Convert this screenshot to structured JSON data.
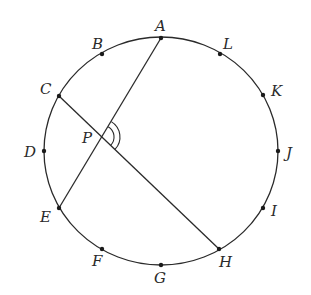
{
  "diagram": {
    "type": "circle-with-intersecting-chords",
    "circle": {
      "cx": 161,
      "cy": 151,
      "rx": 117,
      "ry": 114
    },
    "points": [
      {
        "name": "A",
        "x": 161,
        "y": 38,
        "label_x": 155,
        "label_y": 31
      },
      {
        "name": "B",
        "x": 102,
        "y": 54,
        "label_x": 92,
        "label_y": 49
      },
      {
        "name": "C",
        "x": 59,
        "y": 96,
        "label_x": 40,
        "label_y": 94
      },
      {
        "name": "D",
        "x": 44,
        "y": 151,
        "label_x": 24,
        "label_y": 157
      },
      {
        "name": "E",
        "x": 59,
        "y": 208,
        "label_x": 40,
        "label_y": 222
      },
      {
        "name": "F",
        "x": 102,
        "y": 249,
        "label_x": 92,
        "label_y": 266
      },
      {
        "name": "G",
        "x": 161,
        "y": 265,
        "label_x": 154,
        "label_y": 283
      },
      {
        "name": "H",
        "x": 219,
        "y": 249,
        "label_x": 219,
        "label_y": 267
      },
      {
        "name": "I",
        "x": 263,
        "y": 208,
        "label_x": 271,
        "label_y": 216
      },
      {
        "name": "J",
        "x": 278,
        "y": 151,
        "label_x": 286,
        "label_y": 158
      },
      {
        "name": "K",
        "x": 263,
        "y": 95,
        "label_x": 271,
        "label_y": 96
      },
      {
        "name": "L",
        "x": 220,
        "y": 54,
        "label_x": 223,
        "label_y": 49
      }
    ],
    "chords": [
      {
        "name": "AE",
        "from": "A",
        "to": "E"
      },
      {
        "name": "CH",
        "from": "C",
        "to": "H"
      }
    ],
    "intersection": {
      "name": "P",
      "x": 102,
      "y": 137,
      "label_x": 82,
      "label_y": 143
    },
    "angle_mark": {
      "vertex": "P",
      "between": [
        "A",
        "H"
      ],
      "arcs": 2
    }
  }
}
